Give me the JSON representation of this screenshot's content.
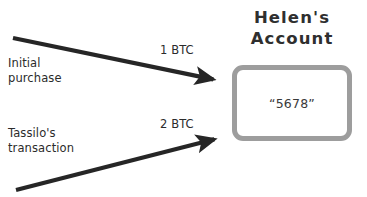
{
  "diagram": {
    "background_color": "#ffffff",
    "arrow_color": "#262626",
    "box_border_color": "#9d9d9d",
    "text_color": "#2b2b2b"
  },
  "account": {
    "title_line_1": "Helen's",
    "title_line_2": "Account",
    "value": "“5678”"
  },
  "flows": [
    {
      "id": "initial-purchase",
      "label": "Initial\npurchase",
      "amount": "1 BTC",
      "direction": "into-account",
      "arrow": {
        "x1": 13,
        "y1": 38,
        "x2": 226,
        "y2": 82
      }
    },
    {
      "id": "tassilo-transaction",
      "label": "Tassilo's\ntransaction",
      "amount": "2 BTC",
      "direction": "into-account",
      "arrow": {
        "x1": 16,
        "y1": 190,
        "x2": 227,
        "y2": 136
      }
    }
  ]
}
